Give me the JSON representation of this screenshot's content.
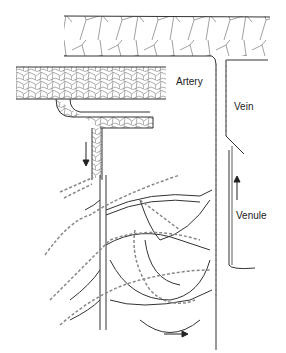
{
  "diagram": {
    "labels": {
      "artery": "Artery",
      "vein": "Vein",
      "venule": "Venule"
    },
    "colors": {
      "outline": "#333333",
      "mesh": "#888888",
      "background": "#ffffff"
    },
    "arrows": [
      {
        "name": "arteriole-flow",
        "direction": "down"
      },
      {
        "name": "venule-flow",
        "direction": "up"
      },
      {
        "name": "capillary-flow",
        "direction": "right"
      }
    ]
  }
}
